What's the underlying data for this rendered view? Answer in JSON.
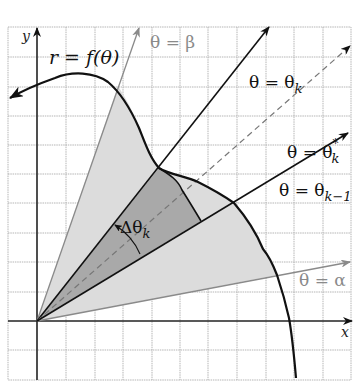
{
  "diagram": {
    "axes": {
      "x_label": "x",
      "y_label": "y"
    },
    "curve_label": "r = f(θ)",
    "rays": {
      "beta": {
        "label": "θ = β",
        "color": "#8a8a8a"
      },
      "alpha": {
        "label": "θ = α",
        "color": "#8a8a8a"
      },
      "theta_k": {
        "label_main": "θ = θ",
        "sub": "k"
      },
      "theta_k_star": {
        "label_main": "θ = θ",
        "sub": "k",
        "sup": "*"
      },
      "theta_k_minus_1": {
        "label_main": "θ = θ",
        "sub": "k−1"
      }
    },
    "delta_label": {
      "main": "Δθ",
      "sub": "k"
    },
    "colors": {
      "light_region": "#dcdcdc",
      "dark_region": "#a9a9a9",
      "grid": "#b5b5b5",
      "curve": "#111111"
    }
  }
}
